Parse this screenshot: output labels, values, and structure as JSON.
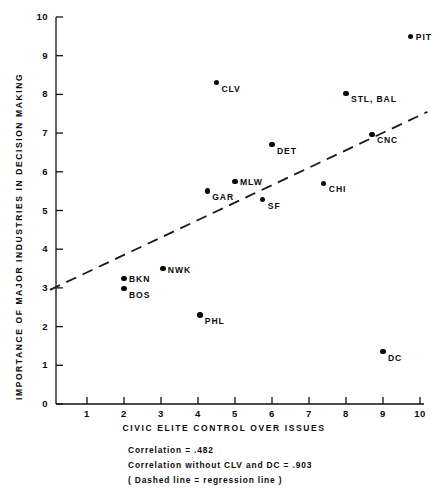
{
  "chart_data": {
    "type": "scatter",
    "title": "",
    "xlabel": "CIVIC ELITE CONTROL OVER ISSUES",
    "ylabel": "IMPORTANCE OF MAJOR INDUSTRIES IN DECISION MAKING",
    "xlim": [
      0,
      10
    ],
    "ylim": [
      0,
      10
    ],
    "grid": false,
    "legend": "none",
    "xticks": [
      "1",
      "2",
      "3",
      "4",
      "5",
      "6",
      "7",
      "8",
      "9",
      "10"
    ],
    "xtick_values": [
      1,
      2,
      3,
      4,
      5,
      6,
      7,
      8,
      9,
      10
    ],
    "yticks": [
      "0",
      "1",
      "2",
      "3",
      "4",
      "5",
      "6",
      "7",
      "8",
      "9",
      "10"
    ],
    "ytick_values": [
      0,
      1,
      2,
      3,
      4,
      5,
      6,
      7,
      8,
      9,
      10
    ],
    "points": [
      {
        "label": "PIT",
        "x": 9.75,
        "y": 9.5,
        "label_pos": "right"
      },
      {
        "label": "CLV",
        "x": 4.5,
        "y": 8.3,
        "label_pos": "right-below"
      },
      {
        "label": "STL, BAL",
        "x": 8.0,
        "y": 8.03,
        "label_pos": "right-below"
      },
      {
        "label": "CNC",
        "x": 8.7,
        "y": 6.97,
        "label_pos": "right-below"
      },
      {
        "label": "DET",
        "x": 6.0,
        "y": 6.7,
        "label_pos": "right-below"
      },
      {
        "label": "MLW",
        "x": 5.0,
        "y": 5.75,
        "label_pos": "right"
      },
      {
        "label": "CHI",
        "x": 7.4,
        "y": 5.7,
        "label_pos": "right-below"
      },
      {
        "label": "GAR",
        "x": 4.25,
        "y": 5.5,
        "label_pos": "right-below"
      },
      {
        "label": "SF",
        "x": 5.75,
        "y": 5.28,
        "label_pos": "right-below"
      },
      {
        "label": "NWK",
        "x": 3.05,
        "y": 3.5,
        "label_pos": "right"
      },
      {
        "label": "BKN",
        "x": 2.0,
        "y": 3.25,
        "label_pos": "right"
      },
      {
        "label": "BOS",
        "x": 2.0,
        "y": 2.98,
        "label_pos": "right-below"
      },
      {
        "label": "PHL",
        "x": 4.05,
        "y": 2.3,
        "label_pos": "right-below"
      },
      {
        "label": "DC",
        "x": 9.0,
        "y": 1.35,
        "label_pos": "right-below"
      }
    ],
    "regression_line": {
      "style": "dashed",
      "x_start": 0.0,
      "y_start": 2.95,
      "x_end": 10.2,
      "y_end": 7.55
    },
    "annotations": [
      "Correlation =  .482",
      "Correlation without   CLV and DC = .903",
      "( Dashed line =  regression line )"
    ],
    "correlation": 0.482,
    "correlation_without_outliers": 0.903,
    "excluded_outliers": [
      "CLV",
      "DC"
    ]
  },
  "colors": {
    "axis": "#111111",
    "marker": "#0a0a0a",
    "regression": "#1a1a1a",
    "background": "#ffffff"
  }
}
